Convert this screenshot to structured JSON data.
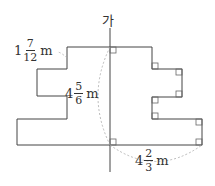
{
  "axis_label": "가",
  "labels": {
    "top_step": {
      "whole": "1",
      "num": "7",
      "den": "12",
      "unit": "m"
    },
    "height": {
      "whole": "4",
      "num": "5",
      "den": "6",
      "unit": "m"
    },
    "bottom_right": {
      "whole": "4",
      "num": "2",
      "den": "3",
      "unit": "m"
    }
  },
  "colors": {
    "line": "#444444",
    "dashed": "#aaaaaa",
    "text": "#333333"
  }
}
